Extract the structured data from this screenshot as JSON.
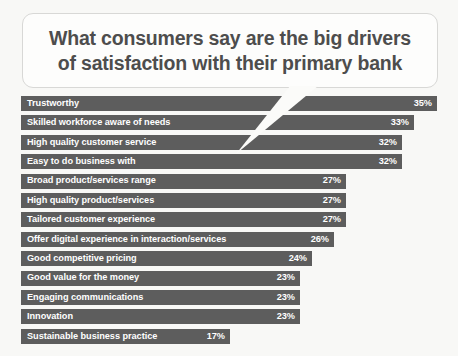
{
  "callout": {
    "title": "What consumers say are the big drivers\nof satisfaction with their primary bank"
  },
  "colors": {
    "background": "#f8f8f6",
    "bar": "#5d5d5d",
    "bar_text": "#ffffff",
    "callout_bg": "#fdfdfc",
    "callout_border": "#d8d8d6",
    "callout_text": "#4d4d4d"
  },
  "chart_data": {
    "type": "bar",
    "orientation": "horizontal",
    "title": "What consumers say are the big drivers of satisfaction with their primary bank",
    "xlabel": "",
    "ylabel": "",
    "xlim": [
      0,
      35
    ],
    "grid": false,
    "legend": false,
    "value_suffix": "%",
    "categories": [
      "Trustworthy",
      "Skilled workforce aware of needs",
      "High quality customer service",
      "Easy to do business with",
      "Broad product/services range",
      "High quality product/services",
      "Tailored customer experience",
      "Offer digital experience in interaction/services",
      "Good competitive pricing",
      "Good value for the money",
      "Engaging communications",
      "Innovation",
      "Sustainable business practice"
    ],
    "values": [
      35,
      33,
      32,
      32,
      27,
      27,
      27,
      26,
      24,
      23,
      23,
      23,
      17
    ],
    "value_labels": [
      "35%",
      "33%",
      "32%",
      "32%",
      "27%",
      "27%",
      "27%",
      "26%",
      "24%",
      "23%",
      "23%",
      "23%",
      "17%"
    ],
    "bar_widths_px": [
      416,
      393,
      381,
      381,
      325,
      325,
      325,
      313,
      291,
      279,
      279,
      279,
      209
    ]
  }
}
